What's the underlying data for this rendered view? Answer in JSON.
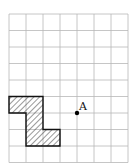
{
  "diagram": {
    "grid": {
      "columns": 7,
      "rows": 9,
      "origin_x": 9,
      "origin_y": 14,
      "cell_w": 17,
      "cell_h": 16.5,
      "line_color": "#b8b8b8"
    },
    "shape": {
      "name": "hatched-polygon",
      "cells": [
        [
          0,
          5
        ],
        [
          1,
          5
        ],
        [
          1,
          6
        ],
        [
          1,
          7
        ],
        [
          2,
          7
        ]
      ],
      "outline_color": "#111111",
      "hatch_color": "#333333"
    },
    "point": {
      "label": "A",
      "grid_x": 4,
      "grid_y": 6,
      "color": "#000000"
    }
  }
}
